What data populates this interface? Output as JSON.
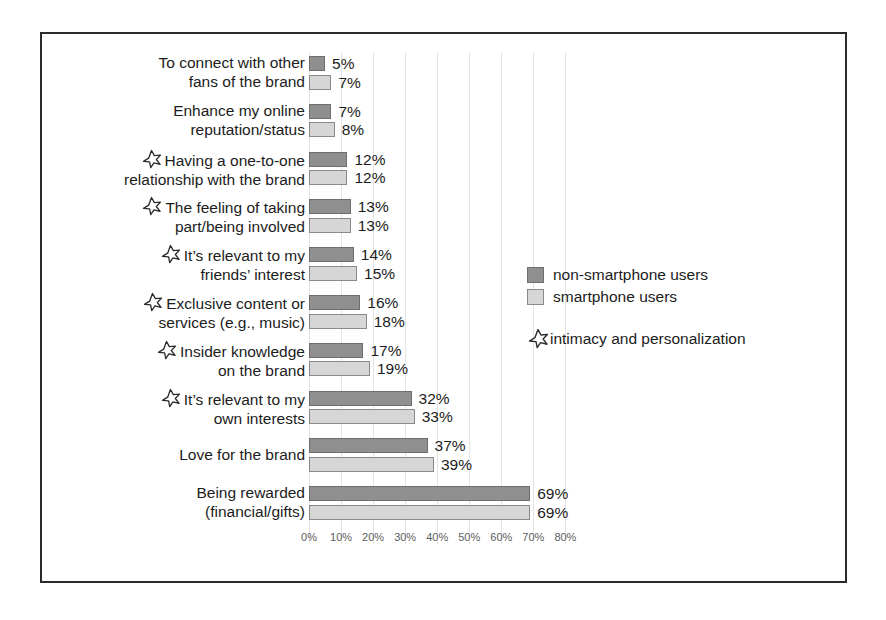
{
  "chart_data": {
    "type": "bar",
    "orientation": "horizontal",
    "title": "",
    "subtitle": "",
    "xlabel": "",
    "ylabel": "",
    "xlim": [
      0,
      80
    ],
    "xtick_labels": [
      "0%",
      "10%",
      "20%",
      "30%",
      "40%",
      "50%",
      "60%",
      "70%",
      "80%"
    ],
    "xtick_values": [
      0,
      10,
      20,
      30,
      40,
      50,
      60,
      70,
      80
    ],
    "grid": true,
    "grid_axis": "x",
    "legend_position": "middle-right",
    "categories": [
      "To connect with other\nfans of the brand",
      "Enhance my online\nreputation/status",
      "Having a one-to-one\nrelationship with the brand",
      "The feeling of taking\npart/being involved",
      "It’s relevant to my\nfriends’ interest",
      "Exclusive content or\nservices (e.g., music)",
      "Insider knowledge\non the brand",
      "It’s relevant to my\nown interests",
      "Love for the brand",
      "Being rewarded\n(financial/gifts)"
    ],
    "category_starred": [
      false,
      false,
      true,
      true,
      true,
      true,
      true,
      true,
      false,
      false
    ],
    "series": [
      {
        "name": "non-smartphone users",
        "color": "#8f8f8f",
        "values": [
          5,
          7,
          12,
          13,
          14,
          16,
          17,
          32,
          37,
          69
        ],
        "value_labels": [
          "5%",
          "7%",
          "12%",
          "13%",
          "14%",
          "16%",
          "17%",
          "32%",
          "37%",
          "69%"
        ]
      },
      {
        "name": "smartphone users",
        "color": "#d6d6d6",
        "values": [
          7,
          8,
          12,
          13,
          15,
          18,
          19,
          33,
          39,
          69
        ],
        "value_labels": [
          "7%",
          "8%",
          "12%",
          "13%",
          "15%",
          "18%",
          "19%",
          "33%",
          "39%",
          "69%"
        ]
      }
    ]
  },
  "legend": {
    "items": [
      {
        "label": "non-smartphone users",
        "swatch": "dark"
      },
      {
        "label": "smartphone users",
        "swatch": "light"
      }
    ],
    "note": {
      "icon": "star-icon",
      "label": "intimacy and personalization"
    }
  },
  "colors": {
    "series_dark": "#8f8f8f",
    "series_light": "#d6d6d6",
    "bar_border": "#6e6e6e",
    "gridline": "#e3e3e3",
    "frame_border": "#2b2b2b",
    "text": "#1c1c1c",
    "axis_text": "#5d5d5d"
  }
}
